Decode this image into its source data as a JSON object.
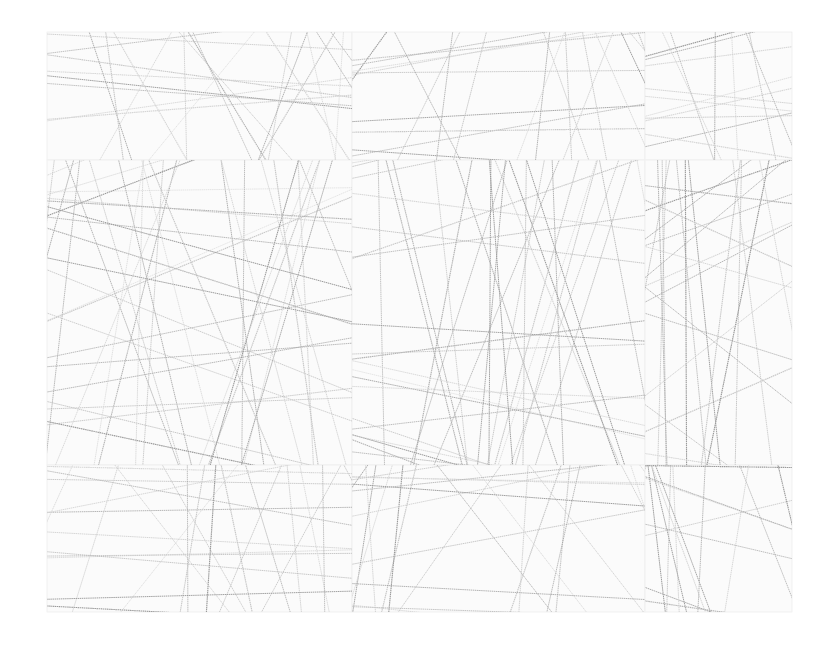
{
  "artwork": {
    "description": "Grid of 9 paper panels covered with thin crisscrossing graphite lines",
    "background": "#ffffff",
    "panel_fill": "#fbfbfb",
    "panel_edge": "#eeeeee",
    "line_colors": [
      "#9a9a9a",
      "#b4b4b4",
      "#c8c8c8",
      "#d6d6d6"
    ],
    "bounds": {
      "x": 47,
      "y": 32,
      "w": 745,
      "h": 580
    },
    "columns": [
      47,
      352,
      645,
      792
    ],
    "rows": [
      32,
      160,
      465,
      612
    ]
  }
}
